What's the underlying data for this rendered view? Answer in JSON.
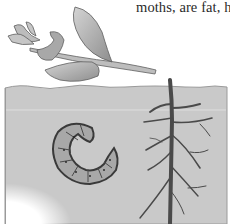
{
  "page": {
    "caption_fragment": "moths, are fat, ha"
  },
  "illustration": {
    "subject": "cutworm-in-soil",
    "elements": [
      "plant-sprig",
      "soil-cross-section",
      "curled-larva",
      "branching-root"
    ],
    "colors": {
      "soil": "#c9c9c9",
      "soil_edge": "#a9a9a9",
      "leaf": "#b4b4b4",
      "leaf_dark": "#7a7a7a",
      "larva": "#a8a8a8",
      "larva_outline": "#3a3a3a",
      "root": "#4a4a4a"
    }
  }
}
